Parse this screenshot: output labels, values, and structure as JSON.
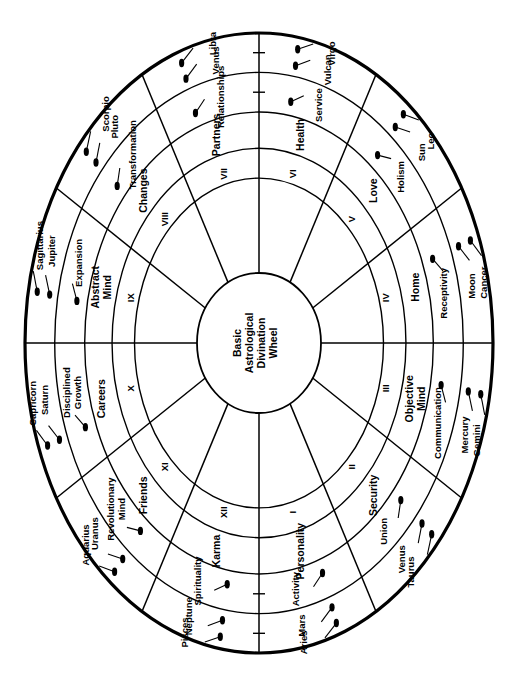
{
  "diagram": {
    "center_lines": [
      "Basic",
      "Astrological",
      "Divination",
      "Wheel"
    ],
    "orientation_note": "rotated-90",
    "colors": {
      "stroke": "#000000",
      "background": "#ffffff",
      "marker": "#000000"
    },
    "geometry": {
      "outer_rx": 234,
      "outer_ry": 310,
      "ring_radii_fraction": [
        1.0,
        0.873,
        0.745,
        0.628,
        0.532
      ],
      "inner_rx": 62,
      "inner_ry": 70,
      "cx": 259,
      "cy": 343
    },
    "rings": [
      {
        "name": "houses",
        "label": "Roman numeral houses"
      },
      {
        "name": "keywords",
        "label": "House keywords"
      },
      {
        "name": "qualities",
        "label": "Qualities"
      },
      {
        "name": "planets",
        "label": "Ruling planets"
      },
      {
        "name": "signs",
        "label": "Zodiac signs"
      }
    ],
    "houses": [
      {
        "numeral": "I",
        "keyword": "Personality",
        "quality": "Activity",
        "planet": "Mars",
        "sign": "Aries"
      },
      {
        "numeral": "II",
        "keyword": "Security",
        "quality": "Union",
        "planet": "Venus",
        "sign": "Taurus"
      },
      {
        "numeral": "III",
        "keyword": "Objective Mind",
        "quality": "Communication",
        "planet": "Mercury",
        "sign": "Gemini"
      },
      {
        "numeral": "IV",
        "keyword": "Home",
        "quality": "Receptivity",
        "planet": "Moon",
        "sign": "Cancer"
      },
      {
        "numeral": "V",
        "keyword": "Love",
        "quality": "Holism",
        "planet": "Sun",
        "sign": "Leo"
      },
      {
        "numeral": "VI",
        "keyword": "Health",
        "quality": "Service",
        "planet": "Vulcan",
        "sign": "Virgo"
      },
      {
        "numeral": "VII",
        "keyword": "Partners",
        "quality": "Relationships",
        "planet": "Venus",
        "sign": "Libra"
      },
      {
        "numeral": "VIII",
        "keyword": "Changes",
        "quality": "Transformation",
        "planet": "Pluto",
        "sign": "Scorpio"
      },
      {
        "numeral": "IX",
        "keyword": "Abstract Mind",
        "quality": "Expansion",
        "planet": "Jupiter",
        "sign": "Sagittarius"
      },
      {
        "numeral": "X",
        "keyword": "Careers",
        "quality": "Disciplined Growth",
        "planet": "Saturn",
        "sign": "Capricorn"
      },
      {
        "numeral": "XI",
        "keyword": "Friends",
        "quality": "Revolutionary Mind",
        "planet": "Uranus",
        "sign": "Aquarius"
      },
      {
        "numeral": "XII",
        "keyword": "Karma",
        "quality": "Spirituality",
        "planet": "Neptune",
        "sign": "Pisces"
      }
    ]
  }
}
